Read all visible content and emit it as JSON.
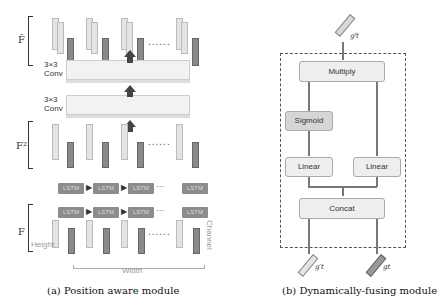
{
  "panel_a": {
    "labels": {
      "f_hat": "F̂",
      "f2": "F²",
      "f": "F",
      "conv_top": "3×3\nConv",
      "conv_top_line1": "3×3",
      "conv_top_line2": "Conv",
      "conv_bottom_line1": "3×3",
      "conv_bottom_line2": "Conv",
      "lstm": "LSTM",
      "height": "Height",
      "width": "Width",
      "channel": "Channel",
      "ellipsis": "......",
      "ellipsis_short": "···"
    },
    "caption": "(a) Position aware module"
  },
  "panel_b": {
    "nodes": {
      "multiply": "Multiply",
      "sigmoid": "Sigmoid",
      "linear_left": "Linear",
      "linear_right": "Linear",
      "concat": "Concat"
    },
    "inputs": {
      "left": "g′t",
      "right": "gt"
    },
    "output": "gᶠt",
    "caption": "(b) Dynamically-fusing module"
  }
}
